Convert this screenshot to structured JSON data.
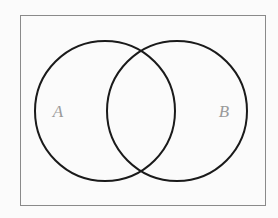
{
  "figure": {
    "type": "venn-diagram",
    "background_color": "#fbfbfb"
  },
  "frame": {
    "name": "universal-set-rectangle",
    "stroke_color": "#8a8a8a",
    "stroke_width": 1,
    "x": 20,
    "y": 15,
    "width": 245,
    "height": 190
  },
  "circles": [
    {
      "id": "A",
      "label": "A",
      "cx": 105,
      "cy": 111,
      "r": 70,
      "stroke_color": "#1a1a1a",
      "stroke_width": 2,
      "fill": "none"
    },
    {
      "id": "B",
      "label": "B",
      "cx": 177,
      "cy": 111,
      "r": 70,
      "stroke_color": "#1a1a1a",
      "stroke_width": 2,
      "fill": "none"
    }
  ],
  "labels": [
    {
      "id": "label-a",
      "text": "A",
      "x": 58,
      "y": 117,
      "color": "#9a9a9a"
    },
    {
      "id": "label-b",
      "text": "B",
      "x": 224,
      "y": 117,
      "color": "#9a9a9a"
    }
  ]
}
